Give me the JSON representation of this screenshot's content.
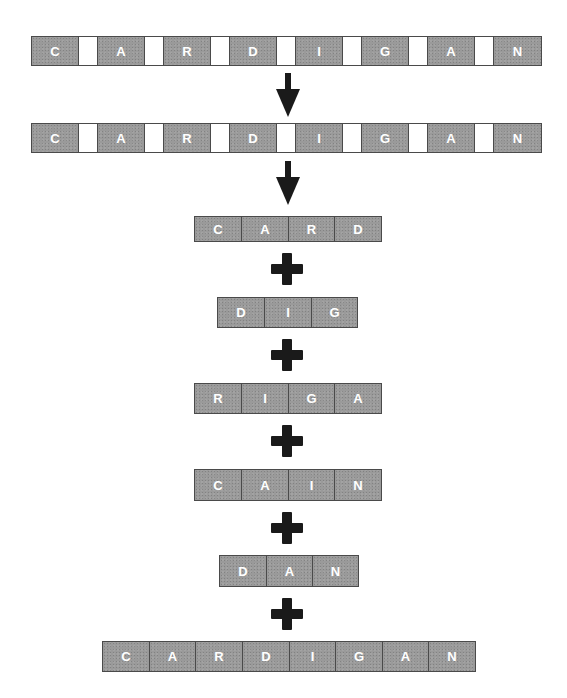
{
  "diagram": {
    "type": "word-decomposition",
    "source_word": "CARDIGAN",
    "colors": {
      "letter_box": "#9a9a9a",
      "letter_text": "#ffffff",
      "gap_box": "#ffffff",
      "border": "#4a4a4a",
      "symbol": "#1a1a1a"
    },
    "spaced_row_1": {
      "letters": [
        "C",
        "A",
        "R",
        "D",
        "I",
        "G",
        "A",
        "N"
      ]
    },
    "arrow_1": "down-arrow",
    "spaced_row_2": {
      "letters": [
        "C",
        "A",
        "R",
        "D",
        "I",
        "G",
        "A",
        "N"
      ]
    },
    "arrow_2": "down-arrow",
    "sub_words": [
      {
        "word": "CARD",
        "letters": [
          "C",
          "A",
          "R",
          "D"
        ]
      },
      {
        "word": "DIG",
        "letters": [
          "D",
          "I",
          "G"
        ]
      },
      {
        "word": "RIGA",
        "letters": [
          "R",
          "I",
          "G",
          "A"
        ]
      },
      {
        "word": "CAIN",
        "letters": [
          "C",
          "A",
          "I",
          "N"
        ]
      },
      {
        "word": "DAN",
        "letters": [
          "D",
          "A",
          "N"
        ]
      }
    ],
    "operator": "+",
    "result": {
      "word": "CARDIGAN",
      "letters": [
        "C",
        "A",
        "R",
        "D",
        "I",
        "G",
        "A",
        "N"
      ]
    }
  }
}
